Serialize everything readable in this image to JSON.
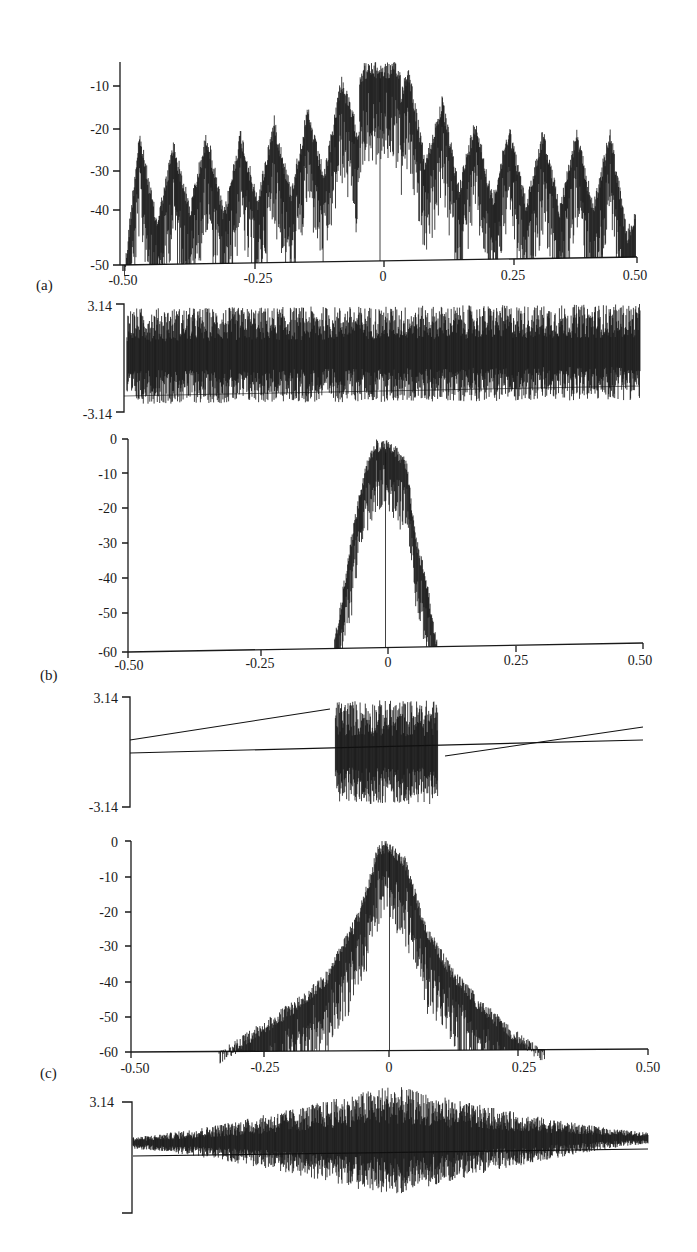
{
  "figure": {
    "panels": [
      {
        "id": "a-mag",
        "label": "(a)"
      },
      {
        "id": "a-phase",
        "label": ""
      },
      {
        "id": "b-mag",
        "label": "(b)"
      },
      {
        "id": "b-phase",
        "label": ""
      },
      {
        "id": "c-mag",
        "label": "(c)"
      },
      {
        "id": "c-phase",
        "label": ""
      }
    ]
  },
  "chart_data": [
    {
      "id": "a-mag",
      "type": "line",
      "panel_label": "(a)",
      "title": "",
      "xlabel": "",
      "ylabel": "",
      "xlim": [
        -0.5,
        0.5
      ],
      "ylim": [
        -50,
        -5
      ],
      "x_ticks": [
        "-0.50",
        "-0.25",
        "0",
        "0.25",
        "0.50"
      ],
      "y_ticks": [
        "-10",
        "-20",
        "-30",
        "-40",
        "-50"
      ],
      "description": "Magnitude spectrum (dB) with a main lobe near 0 reaching about -5 dB, plus periodic sidelobes around -25 to -30 dB peaks repeating across the full band",
      "envelope": {
        "x": [
          -0.5,
          -0.47,
          -0.42,
          -0.36,
          -0.3,
          -0.24,
          -0.18,
          -0.12,
          -0.08,
          -0.03,
          0,
          0.03,
          0.08,
          0.15,
          0.21,
          0.27,
          0.33,
          0.39,
          0.45,
          0.5
        ],
        "peak_db": [
          -40,
          -24,
          -27,
          -23,
          -25,
          -22,
          -20,
          -18,
          -12,
          -5,
          -5,
          -5,
          -13,
          -19,
          -22,
          -23,
          -24,
          -24,
          -24,
          -35
        ]
      },
      "grid": false
    },
    {
      "id": "a-phase",
      "type": "line",
      "panel_label": "",
      "xlim": [
        -0.5,
        0.5
      ],
      "ylim": [
        -3.14,
        3.14
      ],
      "y_ticks": [
        "3.14",
        "-3.14"
      ],
      "description": "Phase (radians) fills nearly the full range [-3.14, 3.14] uniformly, noise-like across the band"
    },
    {
      "id": "b-mag",
      "type": "line",
      "panel_label": "(b)",
      "xlim": [
        -0.5,
        0.5
      ],
      "ylim": [
        -60,
        0
      ],
      "x_ticks": [
        "-0.50",
        "-0.25",
        "0",
        "0.25",
        "0.50"
      ],
      "y_ticks": [
        "0",
        "-10",
        "-20",
        "-30",
        "-40",
        "-50",
        "-60"
      ],
      "description": "Band-limited magnitude spectrum (dB) confined to about |f| < 0.1, peaking near 0 dB and falling to -60 dB at the band edges",
      "envelope": {
        "x": [
          -0.1,
          -0.08,
          -0.06,
          -0.04,
          -0.02,
          0,
          0.02,
          0.04,
          0.06,
          0.08,
          0.1
        ],
        "peak_db": [
          -58,
          -40,
          -22,
          -8,
          0,
          0,
          -2,
          -5,
          -28,
          -40,
          -58
        ]
      },
      "grid": false
    },
    {
      "id": "b-phase",
      "type": "line",
      "panel_label": "",
      "xlim": [
        -0.5,
        0.5
      ],
      "ylim": [
        -3.14,
        3.14
      ],
      "y_ticks": [
        "3.14",
        "-3.14"
      ],
      "description": "Phase is linear outside the passband, rising from about 0.6 at -0.5 to about 2.6 at -0.1. It is noise-like within |f| < 0.1 and linear again from about -0.3 at 0.1 to about 1.3 at 0.5, with a horizontal reference line near 0"
    },
    {
      "id": "c-mag",
      "type": "line",
      "panel_label": "(c)",
      "xlim": [
        -0.5,
        0.5
      ],
      "ylim": [
        -60,
        0
      ],
      "x_ticks": [
        "-0.50",
        "-0.25",
        "0",
        "0.25",
        "0.50"
      ],
      "y_ticks": [
        "0",
        "-10",
        "-20",
        "-30",
        "-40",
        "-50",
        "-60"
      ],
      "description": "Magnitude spectrum (dB) with a triangular/tapered envelope peaking near 0 dB at f=0, decaying to about -60 dB near |f| = 0.3",
      "envelope": {
        "x": [
          -0.33,
          -0.25,
          -0.18,
          -0.12,
          -0.06,
          -0.02,
          0,
          0.03,
          0.07,
          0.12,
          0.18,
          0.25,
          0.3
        ],
        "peak_db": [
          -60,
          -52,
          -45,
          -37,
          -20,
          0,
          0,
          -4,
          -23,
          -36,
          -46,
          -55,
          -60
        ]
      },
      "grid": false
    },
    {
      "id": "c-phase",
      "type": "line",
      "panel_label": "",
      "xlim": [
        -0.5,
        0.5
      ],
      "ylim": [
        -3.14,
        3.14
      ],
      "y_ticks": [
        "3.14",
        ""
      ],
      "description": "Phase is small near the band edges and widely spread (noise-like) in the central region, with a horizontal reference line near 0"
    }
  ]
}
